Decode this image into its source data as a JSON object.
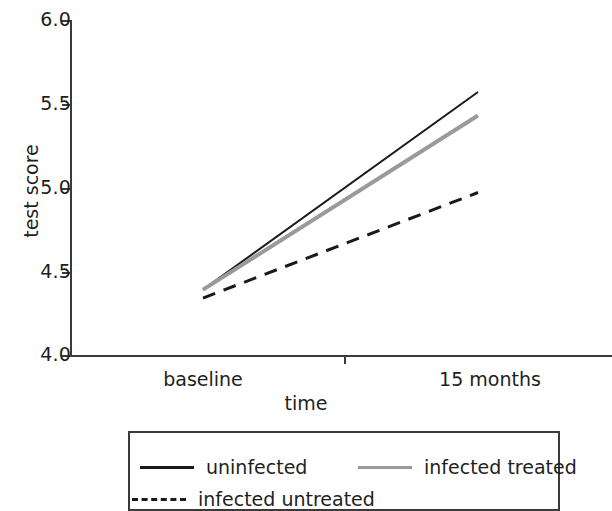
{
  "chart_data": {
    "type": "line",
    "title": "",
    "subtitle": "",
    "xlabel": "time",
    "ylabel": "test score",
    "categories": [
      "baseline",
      "15 months"
    ],
    "x": [
      0,
      1
    ],
    "xlim": [
      0,
      1
    ],
    "ylim": [
      4.0,
      6.0
    ],
    "yticks": [
      "4.0",
      "4.5",
      "5.0",
      "5.5",
      "6.0"
    ],
    "ytick_values": [
      4.0,
      4.5,
      5.0,
      5.5,
      6.0
    ],
    "xticks": [
      "baseline",
      "15 months"
    ],
    "grid": false,
    "legend_position": "below-axes",
    "series": [
      {
        "name": "uninfected",
        "values": [
          4.39,
          5.57
        ],
        "style": "solid",
        "color": "#1a1a1a",
        "width": 2
      },
      {
        "name": "infected treated",
        "values": [
          4.39,
          5.43
        ],
        "style": "solid",
        "color": "#9a9a9a",
        "width": 4
      },
      {
        "name": "infected untreated",
        "values": [
          4.34,
          4.97
        ],
        "style": "dashed",
        "color": "#1a1a1a",
        "width": 3
      }
    ],
    "annotations": []
  },
  "axes": {
    "y_title": "test score",
    "x_title": "time",
    "y_tick_labels": [
      "6.0",
      "5.5",
      "5.0",
      "4.5",
      "4.0"
    ],
    "x_tick_labels": [
      "baseline",
      "15 months"
    ],
    "axis_color": "#3a3a3a"
  },
  "legend": {
    "entries": [
      {
        "label": "uninfected",
        "style": "solid-dark"
      },
      {
        "label": "infected treated",
        "style": "solid-gray"
      },
      {
        "label": "infected untreated",
        "style": "dashed"
      }
    ]
  },
  "colors": {
    "uninfected": "#1a1a1a",
    "infected_treated": "#9a9a9a",
    "infected_untreated": "#1a1a1a",
    "axis": "#3a3a3a",
    "background": "#ffffff"
  }
}
